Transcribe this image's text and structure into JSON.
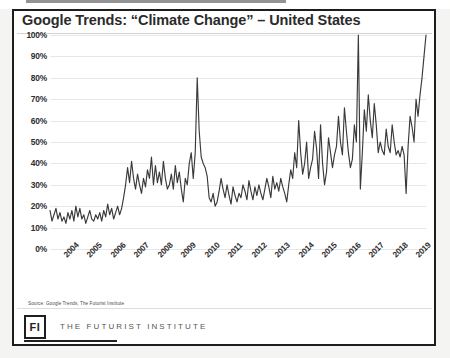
{
  "figure": {
    "title": "Google Trends: “Climate Change” – United States",
    "source_note": "Source:  Google Trends, The Futurist Institute"
  },
  "footer": {
    "logo_mark": "FI",
    "organization": "THE FUTURIST INSTITUTE"
  },
  "chart_data": {
    "type": "line",
    "title": "Google Trends: “Climate Change” – United States",
    "xlabel": "",
    "ylabel": "",
    "ylim": [
      0,
      100
    ],
    "ytick_labels": [
      "100%",
      "90%",
      "80%",
      "70%",
      "60%",
      "50%",
      "40%",
      "30%",
      "20%",
      "10%",
      "0%"
    ],
    "ytick_values": [
      100,
      90,
      80,
      70,
      60,
      50,
      40,
      30,
      20,
      10,
      0
    ],
    "xtick_labels": [
      "2004",
      "2005",
      "2006",
      "2007",
      "2008",
      "2009",
      "2010",
      "2011",
      "2012",
      "2013",
      "2014",
      "2015",
      "2016",
      "2017",
      "2018",
      "2019"
    ],
    "grid": "horizontal",
    "legend": "none",
    "line_color": "#3a3a3a",
    "series": [
      {
        "name": "Climate Change search interest",
        "values": [
          18,
          13,
          16,
          19,
          14,
          17,
          13,
          15,
          12,
          17,
          14,
          18,
          13,
          20,
          15,
          19,
          14,
          16,
          12,
          15,
          18,
          14,
          13,
          16,
          14,
          17,
          13,
          18,
          15,
          21,
          16,
          19,
          14,
          17,
          20,
          16,
          19,
          24,
          30,
          38,
          31,
          41,
          33,
          28,
          35,
          30,
          26,
          33,
          29,
          37,
          33,
          43,
          30,
          39,
          31,
          36,
          30,
          41,
          33,
          28,
          30,
          35,
          28,
          39,
          31,
          36,
          28,
          22,
          33,
          30,
          40,
          45,
          33,
          45,
          80,
          55,
          43,
          40,
          38,
          34,
          24,
          22,
          26,
          20,
          22,
          27,
          33,
          28,
          24,
          30,
          25,
          21,
          29,
          25,
          22,
          26,
          24,
          30,
          27,
          23,
          32,
          27,
          23,
          29,
          25,
          30,
          26,
          23,
          28,
          33,
          29,
          24,
          34,
          28,
          31,
          27,
          33,
          29,
          26,
          22,
          30,
          37,
          33,
          45,
          38,
          60,
          45,
          35,
          40,
          50,
          33,
          38,
          42,
          55,
          47,
          33,
          58,
          40,
          30,
          36,
          52,
          45,
          38,
          44,
          48,
          62,
          50,
          44,
          66,
          55,
          45,
          38,
          42,
          58,
          50,
          100,
          28,
          45,
          65,
          55,
          72,
          60,
          52,
          68,
          58,
          45,
          50,
          46,
          44,
          56,
          48,
          45,
          58,
          50,
          44,
          46,
          43,
          48,
          44,
          26,
          48,
          62,
          57,
          50,
          70,
          62,
          72,
          80,
          90,
          100
        ]
      }
    ],
    "annotations": [
      {
        "label": "peak ~80% (2010)",
        "approx_x": "2010",
        "value": 80
      },
      {
        "label": "peak 100% (late 2016)",
        "approx_x": "2016",
        "value": 100
      },
      {
        "label": "peak 100% (2019)",
        "approx_x": "2019",
        "value": 100
      }
    ]
  }
}
